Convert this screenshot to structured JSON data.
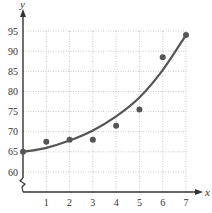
{
  "chart_data": {
    "type": "scatter",
    "title": "",
    "xlabel": "x",
    "ylabel": "y",
    "xlim": [
      0,
      7
    ],
    "ylim": [
      60,
      95
    ],
    "grid": true,
    "axis_break_y": true,
    "x_ticks": [
      "1",
      "2",
      "3",
      "4",
      "5",
      "6",
      "7"
    ],
    "y_ticks": [
      "60",
      "65",
      "70",
      "75",
      "80",
      "85",
      "90",
      "95"
    ],
    "points": [
      {
        "x": 0,
        "y": 65
      },
      {
        "x": 1,
        "y": 67.5
      },
      {
        "x": 2,
        "y": 68
      },
      {
        "x": 3,
        "y": 68
      },
      {
        "x": 4,
        "y": 71.5
      },
      {
        "x": 5,
        "y": 75.5
      },
      {
        "x": 6,
        "y": 88.5
      },
      {
        "x": 7,
        "y": 94
      }
    ],
    "fit_curve": {
      "type": "exponential",
      "description": "smooth increasing curve from (0,65) to (7,94)",
      "samples": [
        {
          "x": 0,
          "y": 65
        },
        {
          "x": 1,
          "y": 66
        },
        {
          "x": 2,
          "y": 67.8
        },
        {
          "x": 3,
          "y": 70.3
        },
        {
          "x": 4,
          "y": 73.8
        },
        {
          "x": 5,
          "y": 78.5
        },
        {
          "x": 6,
          "y": 85.3
        },
        {
          "x": 7,
          "y": 94
        }
      ]
    },
    "colors": {
      "points": "#555555",
      "curve": "#555555",
      "grid": "#bbbbbb",
      "axis": "#333333"
    }
  }
}
